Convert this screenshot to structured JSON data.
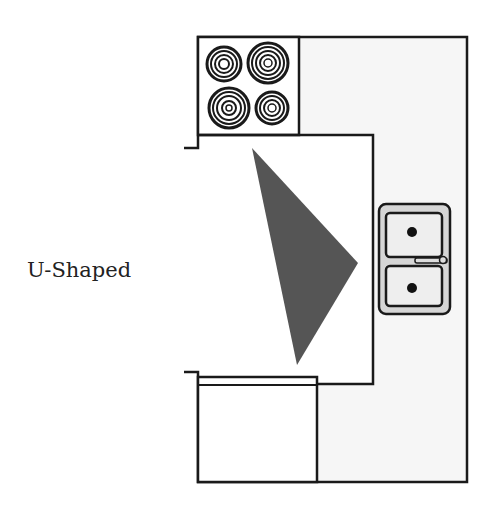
{
  "title": "U-Shaped",
  "colors": {
    "line": "#1a1a1a",
    "counter_fill": "#f6f6f6",
    "triangle": "#555555",
    "sink_fill": "#d6d6d6",
    "basin_fill": "#eeeeee"
  },
  "elements": {
    "stove": "stove with 4 burners",
    "sink": "double basin sink with faucet",
    "work_triangle": "kitchen work triangle",
    "refrigerator": "refrigerator / cabinet box"
  }
}
